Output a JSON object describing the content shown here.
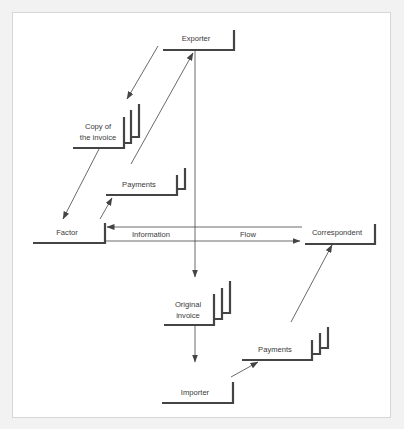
{
  "diagram": {
    "type": "factoring-flow",
    "colors": {
      "background": "#f2f2f2",
      "panel": "#ffffff",
      "border": "#d6d6d6",
      "ink": "#444444",
      "text": "#3a3a3a"
    },
    "nodes": {
      "exporter": {
        "label": "Exporter"
      },
      "copy_invoice": {
        "line1": "Copy of",
        "line2": "the invoice"
      },
      "payments_upper": {
        "label": "Payments"
      },
      "factor": {
        "label": "Factor"
      },
      "correspondent": {
        "label": "Correspondent"
      },
      "original_invoice": {
        "line1": "Original",
        "line2": "invoice"
      },
      "payments_lower": {
        "label": "Payments"
      },
      "importer": {
        "label": "Importer"
      }
    },
    "edge_labels": {
      "information": "Information",
      "flow": "Flow"
    },
    "edges": [
      {
        "from": "exporter",
        "to": "copy_invoice"
      },
      {
        "from": "copy_invoice",
        "to": "factor"
      },
      {
        "from": "factor",
        "to": "payments_upper"
      },
      {
        "from": "payments_upper",
        "to": "exporter"
      },
      {
        "from": "exporter",
        "to": "original_invoice"
      },
      {
        "from": "original_invoice",
        "to": "importer"
      },
      {
        "from": "importer",
        "to": "payments_lower"
      },
      {
        "from": "payments_lower",
        "to": "correspondent"
      },
      {
        "from": "correspondent",
        "to": "factor",
        "label": "Information"
      },
      {
        "from": "factor",
        "to": "correspondent",
        "label": "Flow"
      }
    ]
  }
}
